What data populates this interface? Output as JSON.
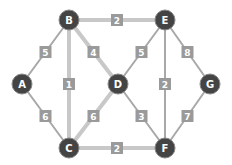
{
  "graph": {
    "node_color": "#444444",
    "edge_color": "#a8a8a8",
    "edge_highlight_color": "#c8c8c8",
    "label_bg_color": "#9a9a9a",
    "nodes": [
      {
        "id": "A",
        "label": "A",
        "x": 22,
        "y": 84
      },
      {
        "id": "B",
        "label": "B",
        "x": 69,
        "y": 20
      },
      {
        "id": "C",
        "label": "C",
        "x": 69,
        "y": 148
      },
      {
        "id": "D",
        "label": "D",
        "x": 118,
        "y": 84
      },
      {
        "id": "E",
        "label": "E",
        "x": 165,
        "y": 20
      },
      {
        "id": "F",
        "label": "F",
        "x": 165,
        "y": 148
      },
      {
        "id": "G",
        "label": "G",
        "x": 210,
        "y": 84
      }
    ],
    "edges": [
      {
        "from": "A",
        "to": "B",
        "weight": "5",
        "highlight": false
      },
      {
        "from": "A",
        "to": "C",
        "weight": "6",
        "highlight": false
      },
      {
        "from": "B",
        "to": "C",
        "weight": "1",
        "highlight": true
      },
      {
        "from": "B",
        "to": "D",
        "weight": "4",
        "highlight": true
      },
      {
        "from": "B",
        "to": "E",
        "weight": "2",
        "highlight": true
      },
      {
        "from": "C",
        "to": "D",
        "weight": "6",
        "highlight": true
      },
      {
        "from": "C",
        "to": "F",
        "weight": "2",
        "highlight": true
      },
      {
        "from": "D",
        "to": "E",
        "weight": "5",
        "highlight": false
      },
      {
        "from": "D",
        "to": "F",
        "weight": "3",
        "highlight": false
      },
      {
        "from": "E",
        "to": "F",
        "weight": "2",
        "highlight": false
      },
      {
        "from": "E",
        "to": "G",
        "weight": "8",
        "highlight": false
      },
      {
        "from": "F",
        "to": "G",
        "weight": "7",
        "highlight": false
      }
    ]
  }
}
